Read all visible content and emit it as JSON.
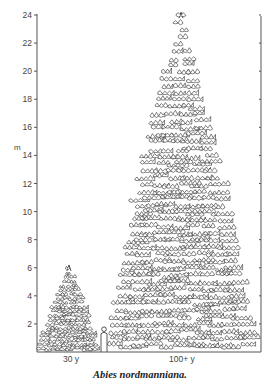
{
  "figure": {
    "caption": "Abies nordmanniana.",
    "y_axis": {
      "unit": "m",
      "min": 0,
      "max": 24,
      "ticks": [
        2,
        4,
        6,
        8,
        10,
        12,
        14,
        16,
        18,
        20,
        22,
        24
      ],
      "tick_labels": [
        "2",
        "4",
        "6",
        "8",
        "10",
        "12",
        "14",
        "16",
        "18",
        "20",
        "22",
        "24"
      ]
    },
    "trees": [
      {
        "name": "young-tree",
        "age_label": "30 y",
        "height_m": 6.2
      },
      {
        "name": "mature-tree",
        "age_label": "100+ y",
        "height_m": 24.2
      }
    ],
    "human_scale_figure": {
      "height_m": 1.8
    },
    "line_color": "#2b2b2b",
    "axis_color": "#555555"
  }
}
